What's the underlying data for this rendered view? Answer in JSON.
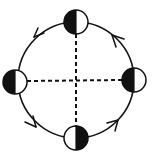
{
  "diagram": {
    "title": "",
    "type": "orbit-phases",
    "colors": {
      "stroke": "#111111",
      "dark": "#111111",
      "light": "#ffffff",
      "background": "#ffffff"
    },
    "orbit": {
      "cx": 76,
      "cy": 80,
      "r": 58,
      "direction": "counterclockwise"
    },
    "axes": {
      "vertical_dashed": true,
      "horizontal_dashed": true
    },
    "bodies": [
      {
        "id": "top",
        "position": "top",
        "cx": 76,
        "cy": 22,
        "r": 12,
        "dark_side": "left"
      },
      {
        "id": "left",
        "position": "left",
        "cx": 15,
        "cy": 82,
        "r": 12,
        "dark_side": "left"
      },
      {
        "id": "right",
        "position": "right",
        "cx": 134,
        "cy": 80,
        "r": 12,
        "dark_side": "left"
      },
      {
        "id": "bottom",
        "position": "bottom",
        "cx": 76,
        "cy": 138,
        "r": 12,
        "dark_side": "right"
      }
    ],
    "arrows": [
      {
        "id": "upper-left",
        "angle_deg": 225,
        "points": "counterclockwise"
      },
      {
        "id": "upper-right",
        "angle_deg": 315,
        "points": "counterclockwise"
      },
      {
        "id": "lower-left",
        "angle_deg": 135,
        "points": "counterclockwise"
      },
      {
        "id": "lower-right",
        "angle_deg": 45,
        "points": "counterclockwise"
      }
    ]
  }
}
